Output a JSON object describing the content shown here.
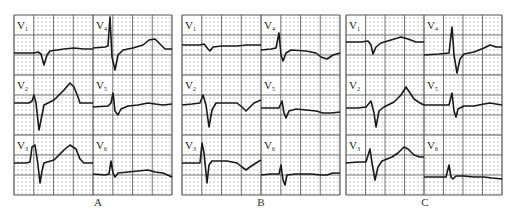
{
  "figure": {
    "colors": {
      "grid_major": "#555555",
      "grid_dot": "#888888",
      "trace": "#1a1a1a",
      "background": "#ffffff",
      "label_box": "#ffffff"
    },
    "panels": [
      {
        "id": "A",
        "label": "A",
        "label_x": 88,
        "x": 14,
        "y": 15,
        "col_w": 79,
        "row_h": 60,
        "leads": [
          {
            "name": "V1",
            "sub": "1",
            "col": 0,
            "row": 0,
            "points": "0,38 20,38 24,37 27,39 30,50 33,40 36,36 50,34 60,33 70,34 79,34"
          },
          {
            "name": "V4",
            "sub": "4",
            "col": 1,
            "row": 0,
            "points": "0,33 12,32 15,31 17,2 19,42 22,55 25,40 30,35 40,33 50,30 56,25 62,24 68,30 72,34 79,34"
          },
          {
            "name": "V2",
            "sub": "2",
            "col": 0,
            "row": 1,
            "points": "0,28 15,28 18,26 20,20 22,28 25,55 28,40 30,30 40,25 50,15 56,8 60,12 64,22 66,28 79,28"
          },
          {
            "name": "V5",
            "sub": "5",
            "col": 1,
            "row": 1,
            "points": "0,32 15,31 18,28 20,18 22,36 25,40 28,34 35,31 45,30 55,28 62,29 70,30 79,29"
          },
          {
            "name": "V3",
            "sub": "3",
            "col": 0,
            "row": 2,
            "points": "0,28 12,28 16,27 18,12 21,10 24,30 26,48 28,36 30,28 40,25 50,15 56,10 62,14 66,24 70,28 79,28"
          },
          {
            "name": "V6",
            "sub": "6",
            "col": 1,
            "row": 2,
            "points": "0,39 12,40 16,39 18,26 20,38 22,42 25,38 35,37 45,36 55,35 62,37 70,38 79,42"
          }
        ]
      },
      {
        "id": "B",
        "label": "B",
        "label_x": 251,
        "x": 182,
        "y": 15,
        "col_w": 79,
        "row_h": 60,
        "leads": [
          {
            "name": "V1",
            "sub": "1",
            "col": 0,
            "row": 0,
            "points": "0,30 18,30 22,29 26,34 28,36 31,32 40,31 55,31 65,30 79,30"
          },
          {
            "name": "V4",
            "sub": "4",
            "col": 1,
            "row": 0,
            "points": "0,35 10,34 15,33 18,18 20,40 22,46 25,38 30,35 45,36 55,38 60,42 66,44 72,40 79,38"
          },
          {
            "name": "V2",
            "sub": "2",
            "col": 0,
            "row": 1,
            "points": "0,30 10,29 18,28 21,20 24,30 27,52 30,35 34,28 45,28 55,28 60,32 64,36 68,32 72,28 79,25"
          },
          {
            "name": "V5",
            "sub": "5",
            "col": 1,
            "row": 1,
            "points": "0,33 10,33 18,33 21,26 23,38 25,43 28,36 35,34 45,35 55,36 62,38 70,38 79,37"
          },
          {
            "name": "V3",
            "sub": "3",
            "col": 0,
            "row": 2,
            "points": "0,28 12,28 18,28 20,8 22,18 25,48 27,30 30,26 45,26 55,28 60,32 64,35 68,32 74,28 79,25"
          },
          {
            "name": "V6",
            "sub": "6",
            "col": 1,
            "row": 2,
            "points": "0,40 10,39 18,39 20,30 22,45 24,50 26,40 35,39 50,39 60,40 66,40 72,38 79,38"
          }
        ]
      },
      {
        "id": "C",
        "label": "C",
        "label_x": 415,
        "x": 346,
        "y": 15,
        "col_w": 78,
        "row_h": 60,
        "leads": [
          {
            "name": "V1",
            "sub": "1",
            "col": 0,
            "row": 0,
            "points": "0,27 15,27 22,26 25,30 27,39 30,32 35,28 45,25 55,22 62,24 70,27 78,27"
          },
          {
            "name": "V4",
            "sub": "4",
            "col": 1,
            "row": 0,
            "points": "0,40 15,39 25,38 28,12 30,40 33,58 36,44 40,39 50,37 60,33 66,30 72,32 78,32"
          },
          {
            "name": "V2",
            "sub": "2",
            "col": 0,
            "row": 1,
            "points": "0,33 12,33 20,32 25,26 28,38 30,52 33,36 38,32 48,27 55,20 60,12 64,18 68,24 74,28 78,30"
          },
          {
            "name": "V5",
            "sub": "5",
            "col": 1,
            "row": 1,
            "points": "0,30 15,30 25,30 28,18 30,36 32,42 34,34 40,31 50,31 60,29 66,28 72,29 78,30"
          },
          {
            "name": "V3",
            "sub": "3",
            "col": 0,
            "row": 2,
            "points": "0,28 12,27 20,27 24,14 26,28 29,45 32,32 36,26 46,22 52,18 58,12 62,14 68,20 74,22 78,22"
          },
          {
            "name": "V6",
            "sub": "6",
            "col": 1,
            "row": 2,
            "points": "0,42 12,42 22,42 25,30 27,42 29,44 32,41 40,41 50,42 60,42 68,43 78,44"
          }
        ]
      }
    ]
  }
}
